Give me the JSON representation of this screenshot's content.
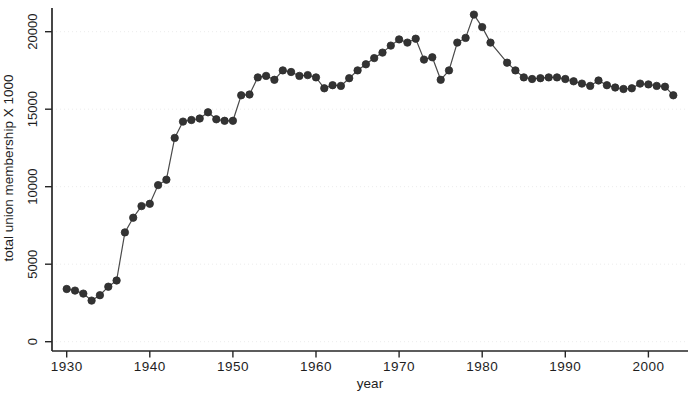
{
  "figure": {
    "background_color": "#ffffff",
    "ink_color": "#262626",
    "series_color": "#333333",
    "line_color": "#4a4a4a",
    "grid_color": "#ececec"
  },
  "chart_data": {
    "type": "line",
    "title": "",
    "xlabel": "year",
    "ylabel": "total union membership X 1000",
    "legend": "none",
    "grid": "very faint horizontal lines at y ticks",
    "marker": "filled-circle",
    "xlim": [
      1928,
      2005
    ],
    "ylim": [
      0,
      21800
    ],
    "x_ticks": [
      1930,
      1940,
      1950,
      1960,
      1970,
      1980,
      1990,
      2000
    ],
    "y_ticks": [
      0,
      5000,
      10000,
      15000,
      20000
    ],
    "x": [
      1930,
      1931,
      1932,
      1933,
      1934,
      1935,
      1936,
      1937,
      1938,
      1939,
      1940,
      1941,
      1942,
      1943,
      1944,
      1945,
      1946,
      1947,
      1948,
      1949,
      1950,
      1951,
      1952,
      1953,
      1954,
      1955,
      1956,
      1957,
      1958,
      1959,
      1960,
      1961,
      1962,
      1963,
      1964,
      1965,
      1966,
      1967,
      1968,
      1969,
      1970,
      1971,
      1972,
      1973,
      1974,
      1975,
      1976,
      1977,
      1978,
      1979,
      1980,
      1981,
      1983,
      1984,
      1985,
      1986,
      1987,
      1988,
      1989,
      1990,
      1991,
      1992,
      1993,
      1994,
      1995,
      1996,
      1997,
      1998,
      1999,
      2000,
      2001,
      2002,
      2003
    ],
    "values": [
      3400,
      3300,
      3100,
      2650,
      3000,
      3550,
      3950,
      7050,
      8000,
      8750,
      8900,
      10100,
      10450,
      13150,
      14200,
      14300,
      14400,
      14800,
      14350,
      14250,
      14250,
      15900,
      15950,
      17050,
      17150,
      16900,
      17500,
      17400,
      17150,
      17200,
      17050,
      16350,
      16550,
      16500,
      17000,
      17500,
      17900,
      18300,
      18650,
      19100,
      19500,
      19300,
      19550,
      18200,
      18350,
      16900,
      17500,
      19300,
      19600,
      21100,
      20300,
      19300,
      18000,
      17500,
      17050,
      16950,
      17000,
      17050,
      17050,
      16950,
      16800,
      16650,
      16500,
      16850,
      16550,
      16400,
      16300,
      16350,
      16650,
      16600,
      16500,
      16450,
      15900
    ]
  }
}
